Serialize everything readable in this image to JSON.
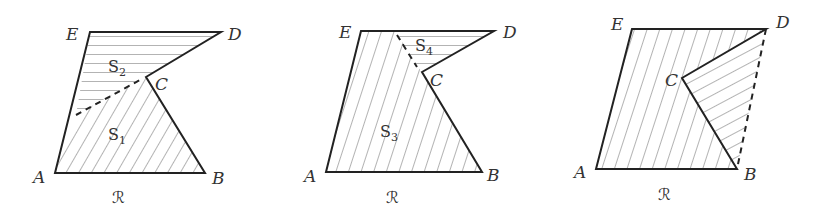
{
  "figure": {
    "panels": [
      {
        "id": "panel-1",
        "vertices": {
          "A": "A",
          "B": "B",
          "C": "C",
          "D": "D",
          "E": "E"
        },
        "subregions": [
          {
            "name": "S",
            "index": "2"
          },
          {
            "name": "S",
            "index": "1"
          }
        ],
        "region_label": "ℛ"
      },
      {
        "id": "panel-2",
        "vertices": {
          "A": "A",
          "B": "B",
          "C": "C",
          "D": "D",
          "E": "E"
        },
        "subregions": [
          {
            "name": "S",
            "index": "4"
          },
          {
            "name": "S",
            "index": "3"
          }
        ],
        "region_label": "ℛ"
      },
      {
        "id": "panel-3",
        "vertices": {
          "A": "A",
          "B": "B",
          "C": "C",
          "D": "D",
          "E": "E"
        },
        "subregions": [],
        "region_label": "ℛ"
      }
    ],
    "colors": {
      "stroke": "#222222",
      "hatch": "#aaaaaa",
      "text": "#333333"
    }
  }
}
